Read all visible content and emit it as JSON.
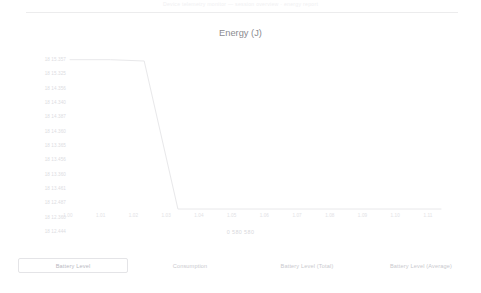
{
  "header": {
    "caption": "Device telemetry monitor  —  session overview  ·  energy report"
  },
  "chart_data": {
    "type": "line",
    "title": "Energy (J)",
    "xlabel": "0 580    580",
    "ylabel": "",
    "grid": false,
    "legend_position": "bottom",
    "categories": [
      "1.00",
      "1.01",
      "1.02",
      "1.03",
      "1.04",
      "1.05",
      "1.06",
      "1.07",
      "1.08",
      "1.09",
      "1.10",
      "1.11"
    ],
    "ytick_labels": [
      "18 15.357",
      "18 15.325",
      "18 14.356",
      "18 14.340",
      "18 14.387",
      "18 14.360",
      "18 13.365",
      "18 13.456",
      "18 13.360",
      "18 13.461",
      "18 12.487",
      "18 12.360",
      "18 12.444"
    ],
    "ylim": [
      18012.444,
      18015.357
    ],
    "series": [
      {
        "name": "Battery Level",
        "color": "#e8e8ea",
        "x": [
          1.0,
          1.012,
          1.022,
          1.032,
          1.11
        ],
        "values": [
          18015.325,
          18015.325,
          18015.3,
          18012.5,
          18012.5
        ]
      }
    ],
    "annotations": []
  },
  "legend": {
    "items": [
      {
        "label": "Battery Level",
        "selected": true
      },
      {
        "label": "Consumption",
        "selected": false
      },
      {
        "label": "Battery Level (Total)",
        "selected": false
      },
      {
        "label": "Battery Level (Average)",
        "selected": false
      }
    ]
  }
}
